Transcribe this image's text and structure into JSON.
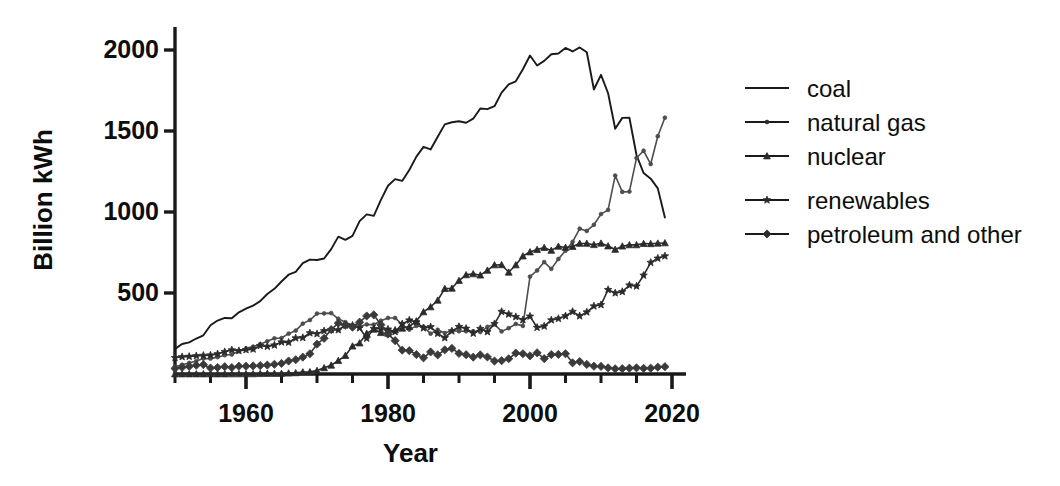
{
  "chart_data": {
    "type": "line",
    "title": "",
    "xlabel": "Year",
    "ylabel": "Billion kWh",
    "xlim": [
      1949,
      2021
    ],
    "ylim": [
      0,
      2150
    ],
    "xticks": [
      1960,
      1980,
      2000,
      2020
    ],
    "xtick_labels": [
      "1960",
      "1980",
      "2000",
      "2020"
    ],
    "minor_xtick_step": 5,
    "yticks": [
      500,
      1000,
      1500,
      2000
    ],
    "ytick_labels": [
      "500",
      "1000",
      "1500",
      "2000"
    ],
    "grid": false,
    "legend_position": "right",
    "x": [
      1950,
      1951,
      1952,
      1953,
      1954,
      1955,
      1956,
      1957,
      1958,
      1959,
      1960,
      1961,
      1962,
      1963,
      1964,
      1965,
      1966,
      1967,
      1968,
      1969,
      1970,
      1971,
      1972,
      1973,
      1974,
      1975,
      1976,
      1977,
      1978,
      1979,
      1980,
      1981,
      1982,
      1983,
      1984,
      1985,
      1986,
      1987,
      1988,
      1989,
      1990,
      1991,
      1992,
      1993,
      1994,
      1995,
      1996,
      1997,
      1998,
      1999,
      2000,
      2001,
      2002,
      2003,
      2004,
      2005,
      2006,
      2007,
      2008,
      2009,
      2010,
      2011,
      2012,
      2013,
      2014,
      2015,
      2016,
      2017,
      2018,
      2019
    ],
    "series": [
      {
        "name": "coal",
        "marker": "none",
        "color": "#1a1a1a",
        "values": [
          155,
          185,
          195,
          219,
          239,
          301,
          330,
          346,
          344,
          381,
          403,
          422,
          450,
          494,
          526,
          571,
          613,
          630,
          684,
          706,
          704,
          713,
          771,
          848,
          828,
          853,
          944,
          985,
          976,
          1075,
          1162,
          1203,
          1192,
          1259,
          1342,
          1402,
          1386,
          1464,
          1541,
          1554,
          1560,
          1551,
          1576,
          1639,
          1635,
          1653,
          1737,
          1788,
          1807,
          1881,
          1966,
          1904,
          1933,
          1974,
          1978,
          2013,
          1991,
          2016,
          1986,
          1756,
          1847,
          1733,
          1514,
          1581,
          1582,
          1352,
          1240,
          1206,
          1146,
          966
        ]
      },
      {
        "name": "natural gas",
        "marker": "dot",
        "color": "#4d4d4d",
        "values": [
          45,
          57,
          68,
          80,
          95,
          95,
          104,
          116,
          120,
          142,
          158,
          169,
          184,
          202,
          220,
          222,
          249,
          268,
          311,
          333,
          373,
          374,
          376,
          341,
          320,
          300,
          295,
          306,
          305,
          329,
          346,
          346,
          305,
          274,
          297,
          292,
          249,
          273,
          253,
          267,
          264,
          264,
          264,
          259,
          291,
          307,
          263,
          283,
          309,
          297,
          601,
          639,
          691,
          649,
          710,
          761,
          816,
          897,
          883,
          921,
          987,
          1013,
          1225,
          1124,
          1126,
          1333,
          1378,
          1296,
          1468,
          1582
        ]
      },
      {
        "name": "nuclear",
        "marker": "triangle",
        "color": "#2b2b2b",
        "values": [
          0,
          0,
          0,
          0,
          0,
          0,
          0,
          0,
          0.2,
          0.2,
          0.5,
          0.5,
          2,
          3,
          3,
          3,
          5,
          7,
          12,
          13,
          21,
          38,
          54,
          83,
          114,
          172,
          191,
          250,
          276,
          255,
          251,
          272,
          282,
          293,
          327,
          383,
          414,
          455,
          527,
          529,
          577,
          612,
          618,
          610,
          640,
          673,
          674,
          628,
          673,
          728,
          753,
          768,
          780,
          763,
          788,
          781,
          787,
          806,
          806,
          798,
          807,
          790,
          769,
          789,
          797,
          797,
          805,
          804,
          807,
          809
        ]
      },
      {
        "name": "renewables",
        "marker": "star",
        "color": "#2b2b2b",
        "values": [
          100,
          106,
          108,
          112,
          114,
          116,
          124,
          137,
          148,
          143,
          149,
          153,
          175,
          170,
          178,
          197,
          195,
          222,
          224,
          253,
          248,
          266,
          273,
          272,
          301,
          300,
          284,
          220,
          280,
          280,
          276,
          261,
          309,
          332,
          321,
          284,
          291,
          250,
          223,
          265,
          292,
          281,
          251,
          280,
          260,
          310,
          385,
          369,
          353,
          334,
          356,
          287,
          295,
          333,
          342,
          358,
          385,
          358,
          382,
          419,
          427,
          520,
          500,
          508,
          548,
          542,
          609,
          688,
          714,
          728
        ]
      },
      {
        "name": "petroleum and other",
        "marker": "diamond",
        "color": "#3a3a3a",
        "values": [
          34,
          41,
          47,
          54,
          58,
          37,
          40,
          45,
          40,
          48,
          48,
          50,
          52,
          55,
          60,
          65,
          80,
          88,
          104,
          125,
          184,
          220,
          274,
          314,
          301,
          289,
          320,
          358,
          365,
          304,
          246,
          206,
          147,
          144,
          120,
          100,
          136,
          118,
          149,
          158,
          127,
          119,
          104,
          118,
          105,
          80,
          82,
          94,
          129,
          125,
          112,
          131,
          95,
          120,
          121,
          125,
          69,
          77,
          59,
          48,
          47,
          38,
          32,
          33,
          36,
          38,
          35,
          36,
          42,
          45
        ]
      }
    ]
  },
  "legend": {
    "items": [
      {
        "label": "coal",
        "marker": "none"
      },
      {
        "label": "natural gas",
        "marker": "dot"
      },
      {
        "label": "nuclear",
        "marker": "triangle"
      },
      {
        "label": "renewables",
        "marker": "star"
      },
      {
        "label": "petroleum and other",
        "marker": "diamond"
      }
    ]
  }
}
